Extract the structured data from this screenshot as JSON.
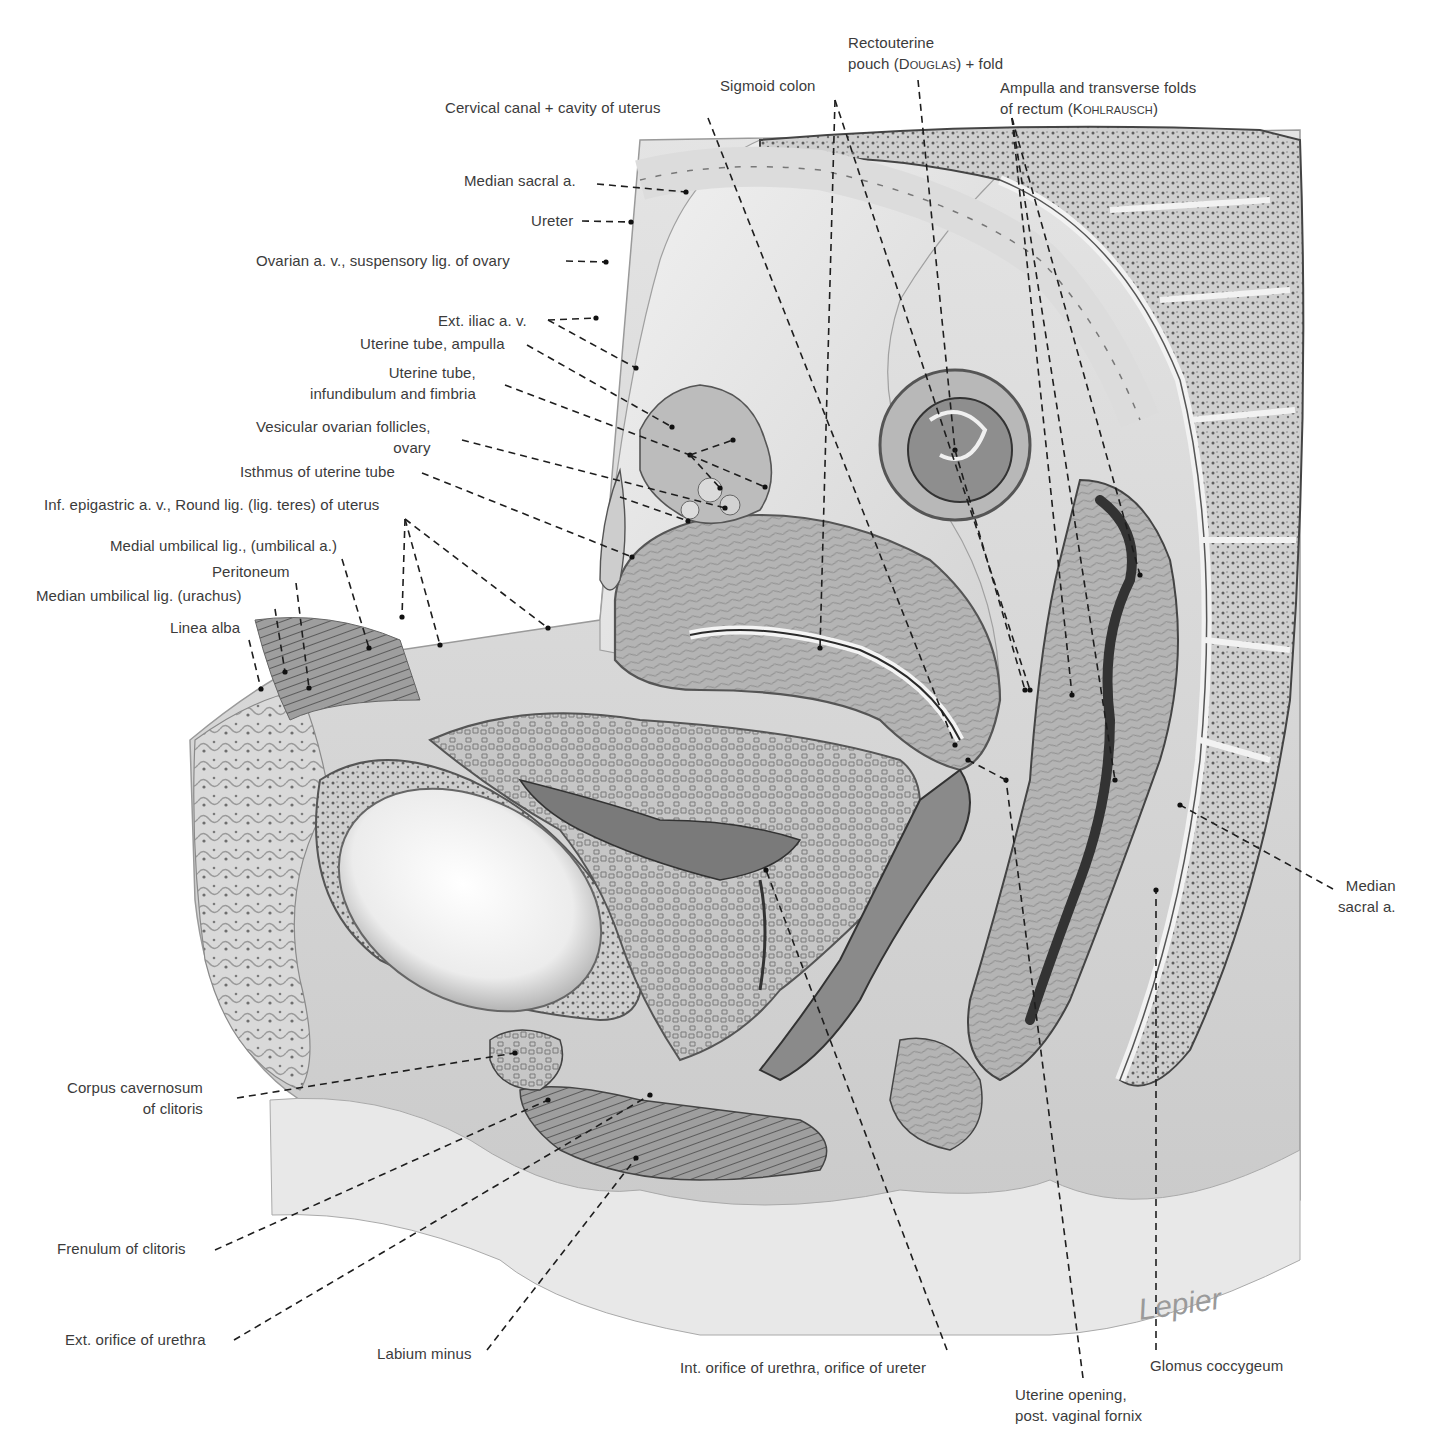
{
  "figure": {
    "signature": "Lepier",
    "colors": {
      "background": "#ffffff",
      "tissue_light": "#e6e6e6",
      "tissue_mid": "#bdbdbd",
      "tissue_dark": "#6e6e6e",
      "ink": "#222222",
      "label_text": "#3b3b3b"
    }
  },
  "labels": [
    {
      "id": "rectouterine-pouch",
      "text": "Rectouterine\npouch (Douglas) + fold",
      "x": 848,
      "y": 32,
      "align": "left",
      "line": [
        [
          918,
          80
        ],
        [
          955,
          450
        ]
      ]
    },
    {
      "id": "sigmoid-colon",
      "text": "Sigmoid colon",
      "x": 720,
      "y": 75,
      "align": "left",
      "line": [
        [
          835,
          100
        ],
        [
          1030,
          690
        ]
      ]
    },
    {
      "id": "ampulla-rectum",
      "text": "Ampulla and transverse folds\nof rectum (Kohlrausch)",
      "x": 1000,
      "y": 77,
      "align": "left",
      "line": [
        [
          1012,
          118
        ],
        [
          1115,
          780
        ]
      ]
    },
    {
      "id": "cervical-canal",
      "text": "Cervical canal + cavity of uterus",
      "x": 445,
      "y": 97,
      "align": "left",
      "line": [
        [
          708,
          118
        ],
        [
          955,
          745
        ]
      ]
    },
    {
      "id": "median-sacral-a-top",
      "text": "Median sacral a.",
      "x": 464,
      "y": 170,
      "align": "left",
      "line": [
        [
          597,
          184
        ],
        [
          686,
          192
        ]
      ]
    },
    {
      "id": "ureter",
      "text": "Ureter",
      "x": 531,
      "y": 210,
      "align": "left",
      "line": [
        [
          582,
          221
        ],
        [
          631,
          222
        ]
      ]
    },
    {
      "id": "ovarian-av",
      "text": "Ovarian a. v., suspensory lig. of ovary",
      "x": 256,
      "y": 250,
      "align": "left",
      "line": [
        [
          566,
          261
        ],
        [
          606,
          262
        ]
      ]
    },
    {
      "id": "ext-iliac",
      "text": "Ext. iliac a. v.",
      "x": 438,
      "y": 310,
      "align": "left",
      "line": [
        [
          548,
          320
        ],
        [
          596,
          318
        ]
      ]
    },
    {
      "id": "uterine-tube-ampulla",
      "text": "Uterine tube, ampulla",
      "x": 360,
      "y": 333,
      "align": "left",
      "line": [
        [
          527,
          345
        ],
        [
          672,
          427
        ]
      ]
    },
    {
      "id": "uterine-tube-infundibulum",
      "text": "Uterine tube,\ninfundibulum and fimbria",
      "x": 310,
      "y": 362,
      "align": "right",
      "line": [
        [
          505,
          385
        ],
        [
          690,
          455
        ]
      ]
    },
    {
      "id": "vesicular-follicles",
      "text": "Vesicular ovarian follicles,\novary",
      "x": 256,
      "y": 416,
      "align": "right",
      "line": [
        [
          462,
          440
        ],
        [
          725,
          508
        ]
      ]
    },
    {
      "id": "isthmus-tube",
      "text": "Isthmus of uterine tube",
      "x": 240,
      "y": 461,
      "align": "left",
      "line": [
        [
          422,
          473
        ],
        [
          632,
          557
        ]
      ]
    },
    {
      "id": "inf-epigastric",
      "text": "Inf. epigastric a. v., Round lig. (lig. teres) of uterus",
      "x": 44,
      "y": 494,
      "align": "left",
      "line": [
        [
          405,
          519
        ],
        [
          402,
          617
        ]
      ]
    },
    {
      "id": "medial-umbilical",
      "text": "Medial umbilical lig., (umbilical a.)",
      "x": 110,
      "y": 535,
      "align": "left",
      "line": [
        [
          342,
          559
        ],
        [
          369,
          648
        ]
      ]
    },
    {
      "id": "peritoneum",
      "text": "Peritoneum",
      "x": 212,
      "y": 561,
      "align": "left",
      "line": [
        [
          296,
          583
        ],
        [
          309,
          688
        ]
      ]
    },
    {
      "id": "median-umbilical",
      "text": "Median umbilical lig. (urachus)",
      "x": 36,
      "y": 585,
      "align": "left",
      "line": [
        [
          275,
          609
        ],
        [
          285,
          672
        ]
      ]
    },
    {
      "id": "linea-alba",
      "text": "Linea alba",
      "x": 170,
      "y": 617,
      "align": "left",
      "line": [
        [
          249,
          640
        ],
        [
          261,
          689
        ]
      ]
    },
    {
      "id": "median-sacral-a-right",
      "text": "Median\nsacral a.",
      "x": 1338,
      "y": 875,
      "align": "right",
      "line": [
        [
          1333,
          889
        ],
        [
          1180,
          805
        ]
      ]
    },
    {
      "id": "corpus-cavernosum",
      "text": "Corpus cavernosum\nof clitoris",
      "x": 67,
      "y": 1077,
      "align": "right",
      "line": [
        [
          237,
          1098
        ],
        [
          515,
          1053
        ]
      ]
    },
    {
      "id": "frenulum",
      "text": "Frenulum of clitoris",
      "x": 57,
      "y": 1238,
      "align": "left",
      "line": [
        [
          215,
          1250
        ],
        [
          548,
          1100
        ]
      ]
    },
    {
      "id": "ext-orifice-urethra",
      "text": "Ext. orifice of urethra",
      "x": 65,
      "y": 1329,
      "align": "left",
      "line": [
        [
          234,
          1340
        ],
        [
          650,
          1095
        ]
      ]
    },
    {
      "id": "labium-minus",
      "text": "Labium minus",
      "x": 377,
      "y": 1343,
      "align": "left",
      "line": [
        [
          487,
          1350
        ],
        [
          636,
          1158
        ]
      ]
    },
    {
      "id": "int-orifice-urethra",
      "text": "Int. orifice of urethra, orifice of ureter",
      "x": 680,
      "y": 1357,
      "align": "left",
      "line": [
        [
          947,
          1350
        ],
        [
          766,
          870
        ]
      ]
    },
    {
      "id": "glomus-coccygeum",
      "text": "Glomus coccygeum",
      "x": 1150,
      "y": 1355,
      "align": "left",
      "line": [
        [
          1156,
          1350
        ],
        [
          1156,
          890
        ]
      ]
    },
    {
      "id": "uterine-opening",
      "text": "Uterine opening,\npost. vaginal fornix",
      "x": 1015,
      "y": 1384,
      "align": "left",
      "line": [
        [
          1083,
          1378
        ],
        [
          1006,
          780
        ]
      ]
    }
  ],
  "extra_leaders": [
    {
      "label_id": "ext-iliac",
      "line": [
        [
          548,
          320
        ],
        [
          636,
          368
        ]
      ]
    },
    {
      "label_id": "uterine-tube-infundibulum",
      "line": [
        [
          690,
          455
        ],
        [
          733,
          440
        ]
      ]
    },
    {
      "label_id": "uterine-tube-infundibulum",
      "line": [
        [
          690,
          455
        ],
        [
          765,
          487
        ]
      ]
    },
    {
      "label_id": "uterine-tube-infundibulum",
      "line": [
        [
          690,
          455
        ],
        [
          720,
          488
        ]
      ]
    },
    {
      "label_id": "vesicular-follicles",
      "line": [
        [
          620,
          497
        ],
        [
          688,
          521
        ]
      ]
    },
    {
      "label_id": "inf-epigastric",
      "line": [
        [
          405,
          519
        ],
        [
          440,
          645
        ]
      ]
    },
    {
      "label_id": "inf-epigastric",
      "line": [
        [
          405,
          519
        ],
        [
          548,
          628
        ]
      ]
    },
    {
      "label_id": "rectouterine-pouch",
      "line": [
        [
          955,
          450
        ],
        [
          1025,
          690
        ]
      ]
    },
    {
      "label_id": "sigmoid-colon",
      "line": [
        [
          835,
          100
        ],
        [
          820,
          648
        ]
      ]
    },
    {
      "label_id": "ampulla-rectum",
      "line": [
        [
          1012,
          118
        ],
        [
          1140,
          575
        ]
      ]
    },
    {
      "label_id": "ampulla-rectum",
      "line": [
        [
          1012,
          118
        ],
        [
          1072,
          695
        ]
      ]
    },
    {
      "label_id": "uterine-opening",
      "line": [
        [
          1006,
          780
        ],
        [
          968,
          760
        ]
      ]
    }
  ]
}
